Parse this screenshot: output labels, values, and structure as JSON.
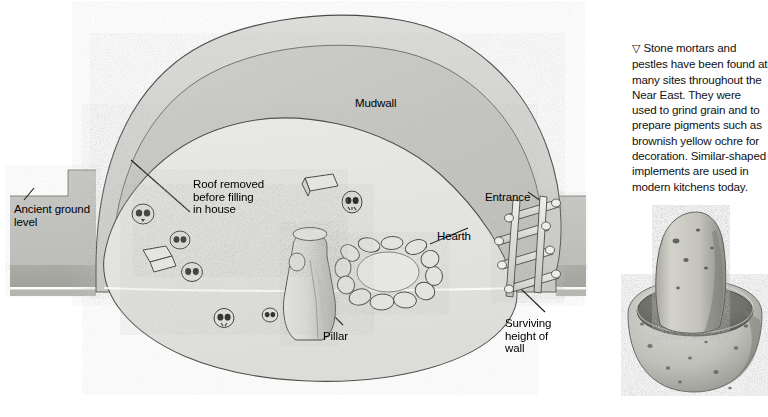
{
  "figure": {
    "labels": [
      {
        "id": "ancient-ground-level",
        "text": "Ancient ground\nlevel",
        "x": 14,
        "y": 203
      },
      {
        "id": "roof-removed",
        "text": "Roof removed\nbefore filling\nin house",
        "x": 193,
        "y": 178
      },
      {
        "id": "mudwall",
        "text": "Mudwall",
        "x": 355,
        "y": 97
      },
      {
        "id": "hearth",
        "text": "Hearth",
        "x": 437,
        "y": 230
      },
      {
        "id": "entrance",
        "text": "Entrance",
        "x": 485,
        "y": 191
      },
      {
        "id": "pillar",
        "text": "Pillar",
        "x": 323,
        "y": 330
      },
      {
        "id": "surviving-height-of-wall",
        "text": "Surviving\nheight of\nwall",
        "x": 505,
        "y": 317
      }
    ],
    "colors": {
      "mound_outer": "#d7d7d5",
      "mound_mid": "#c9c9c6",
      "mound_inner": "#e6e6e3",
      "fill_interior": "#dededb",
      "ground_upper": "#c2c2bf",
      "ground_lower": "#a9a9a5",
      "outline": "#3b3b3b",
      "white_line": "#ffffff"
    }
  },
  "caption": {
    "marker": "▽",
    "text": "Stone mortars and pestles have been found at many sites throughout the Near East. They were used to grind grain and to prepare pigments such as brownish yellow ochre for decoration. Similar-shaped implements are used in modern kitchens today."
  },
  "mortar": {
    "id": "stone-mortar-and-pestle-photo",
    "colors": {
      "stone_light": "#d2d2cd",
      "stone_mid": "#b3b3ad",
      "stone_dark": "#8f8f89",
      "speck": "#55554f"
    }
  }
}
